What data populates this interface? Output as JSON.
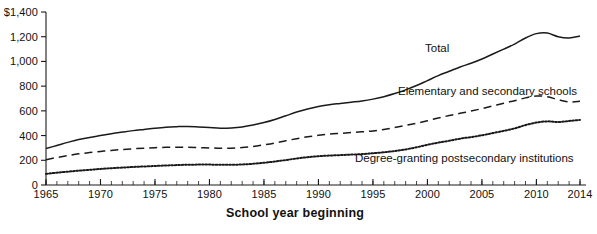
{
  "chart_data": {
    "type": "line",
    "title": "",
    "xlabel": "School year beginning",
    "ylabel": "",
    "xlim": [
      1965,
      2014
    ],
    "ylim": [
      0,
      1400
    ],
    "grid": false,
    "legend_position": "inline-annotations",
    "y_ticks": [
      {
        "value": 1400,
        "label": "$1,400"
      },
      {
        "value": 1200,
        "label": "1,200"
      },
      {
        "value": 1000,
        "label": "1,000"
      },
      {
        "value": 800,
        "label": "800"
      },
      {
        "value": 600,
        "label": "600"
      },
      {
        "value": 400,
        "label": "400"
      },
      {
        "value": 200,
        "label": "200"
      },
      {
        "value": 0,
        "label": "0"
      }
    ],
    "x_ticks": [
      {
        "value": 1965,
        "label": "1965"
      },
      {
        "value": 1970,
        "label": "1970"
      },
      {
        "value": 1975,
        "label": "1975"
      },
      {
        "value": 1980,
        "label": "1980"
      },
      {
        "value": 1985,
        "label": "1985"
      },
      {
        "value": 1990,
        "label": "1990"
      },
      {
        "value": 1995,
        "label": "1995"
      },
      {
        "value": 2000,
        "label": "2000"
      },
      {
        "value": 2005,
        "label": "2005"
      },
      {
        "value": 2010,
        "label": "2010"
      },
      {
        "value": 2014,
        "label": "2014"
      }
    ],
    "x": [
      1965,
      1966,
      1967,
      1968,
      1969,
      1970,
      1971,
      1972,
      1973,
      1974,
      1975,
      1976,
      1977,
      1978,
      1979,
      1980,
      1981,
      1982,
      1983,
      1984,
      1985,
      1986,
      1987,
      1988,
      1989,
      1990,
      1991,
      1992,
      1993,
      1994,
      1995,
      1996,
      1997,
      1998,
      1999,
      2000,
      2001,
      2002,
      2003,
      2004,
      2005,
      2006,
      2007,
      2008,
      2009,
      2010,
      2011,
      2012,
      2013,
      2014
    ],
    "series": [
      {
        "name": "Total",
        "style": "solid",
        "color": "#1a1a1a",
        "label": "Total",
        "values": [
          295,
          320,
          345,
          368,
          385,
          400,
          415,
          428,
          440,
          450,
          460,
          468,
          472,
          474,
          470,
          465,
          460,
          462,
          470,
          485,
          505,
          530,
          560,
          590,
          615,
          635,
          650,
          660,
          670,
          680,
          695,
          715,
          740,
          770,
          805,
          845,
          885,
          920,
          955,
          985,
          1020,
          1060,
          1100,
          1140,
          1190,
          1225,
          1230,
          1200,
          1190,
          1205
        ]
      },
      {
        "name": "Elementary and secondary schools",
        "style": "dashed",
        "color": "#1a1a1a",
        "label": "Elementary and secondary schools",
        "values": [
          205,
          222,
          238,
          252,
          262,
          272,
          280,
          287,
          293,
          298,
          302,
          305,
          306,
          306,
          303,
          300,
          297,
          298,
          303,
          312,
          325,
          340,
          358,
          375,
          390,
          402,
          412,
          418,
          424,
          430,
          438,
          450,
          465,
          482,
          500,
          520,
          542,
          562,
          580,
          598,
          618,
          640,
          662,
          682,
          705,
          720,
          715,
          690,
          672,
          678
        ]
      },
      {
        "name": "Degree-granting postsecondary institutions",
        "style": "dotted",
        "color": "#1a1a1a",
        "label": "Degree-granting postsecondary institutions",
        "values": [
          90,
          100,
          108,
          116,
          123,
          130,
          136,
          141,
          146,
          150,
          154,
          158,
          161,
          164,
          165,
          165,
          164,
          164,
          166,
          172,
          180,
          190,
          202,
          215,
          225,
          233,
          238,
          242,
          246,
          250,
          257,
          265,
          275,
          288,
          305,
          325,
          343,
          358,
          375,
          388,
          402,
          420,
          438,
          458,
          485,
          505,
          515,
          510,
          518,
          527
        ]
      }
    ]
  },
  "axes": {
    "x_title": "School year beginning"
  }
}
